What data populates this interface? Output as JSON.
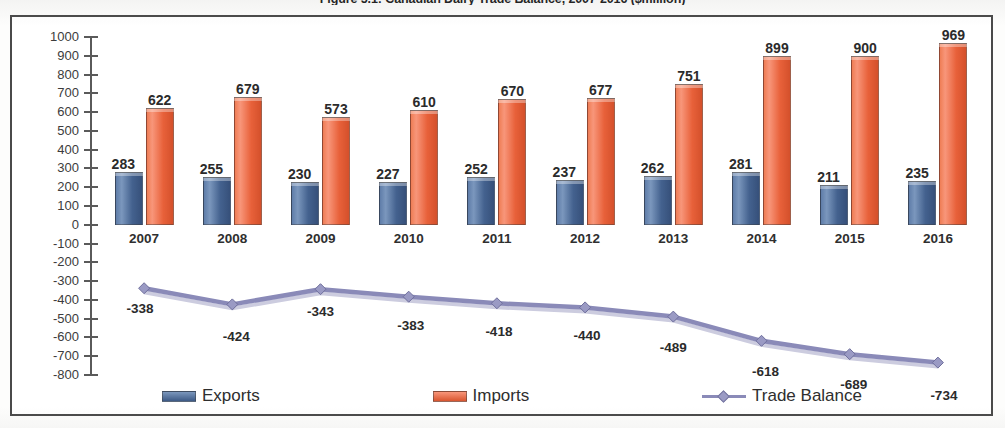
{
  "chart_data": {
    "type": "bar",
    "title": "Figure 5.1: Canadian Dairy Trade Balance, 2007-2016 ($million)",
    "xlabel": "",
    "ylabel": "",
    "ylim": [
      -800,
      1000
    ],
    "ytick_step": 100,
    "grid": false,
    "legend_position": "bottom",
    "categories": [
      "2007",
      "2008",
      "2009",
      "2010",
      "2011",
      "2012",
      "2013",
      "2014",
      "2015",
      "2016"
    ],
    "series": [
      {
        "name": "Exports",
        "chart_type": "bar",
        "color": "#4a6a98",
        "values": [
          283,
          255,
          230,
          227,
          252,
          237,
          262,
          281,
          211,
          235
        ]
      },
      {
        "name": "Imports",
        "chart_type": "bar",
        "color": "#e8663c",
        "values": [
          622,
          679,
          573,
          610,
          670,
          677,
          751,
          899,
          900,
          969
        ]
      },
      {
        "name": "Trade Balance",
        "chart_type": "line",
        "color": "#8a8ab8",
        "values": [
          -338,
          -424,
          -343,
          -383,
          -418,
          -440,
          -489,
          -618,
          -689,
          -734
        ]
      }
    ],
    "ytick_labels": [
      "1000",
      "900",
      "800",
      "700",
      "600",
      "500",
      "400",
      "300",
      "200",
      "100",
      "0",
      "-100",
      "-200",
      "-300",
      "-400",
      "-500",
      "-600",
      "-700",
      "-800"
    ]
  },
  "legend": {
    "items": [
      {
        "label": "Exports",
        "color": "#4a6a98",
        "marker": "square-swatch"
      },
      {
        "label": "Imports",
        "color": "#e8663c",
        "marker": "square-swatch"
      },
      {
        "label": "Trade Balance",
        "color": "#8a8ab8",
        "marker": "line-diamond"
      }
    ]
  },
  "colors": {
    "exports": "#4a6a98",
    "imports": "#e8663c",
    "trade_balance": "#8a8ab8",
    "axis": "#5a5a5a",
    "frame": "#4a4a4a",
    "text": "#2b2b2b",
    "background": "#ffffff"
  }
}
